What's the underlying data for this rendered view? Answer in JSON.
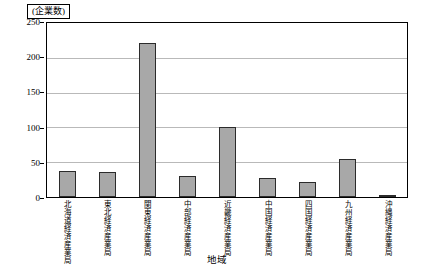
{
  "chart_data": {
    "type": "bar",
    "title": "",
    "unit_label": "(企業数)",
    "xlabel": "地域",
    "ylabel": "",
    "ylim": [
      0,
      250
    ],
    "yticks": [
      0,
      50,
      100,
      150,
      200,
      250
    ],
    "grid": true,
    "legend": false,
    "categories": [
      "北海道経済産業局",
      "東北経済産業局",
      "関東経済産業局",
      "中部経済産業局",
      "近畿経済産業局",
      "中国経済産業局",
      "四国経済産業局",
      "九州経済産業局",
      "沖縄経済産業局"
    ],
    "values": [
      38,
      36,
      221,
      30,
      100,
      28,
      21,
      55,
      2
    ],
    "bar_fill": "#a8a8a8",
    "bar_stroke": "#2b2b2b",
    "grid_color": "#b9b9b9"
  }
}
